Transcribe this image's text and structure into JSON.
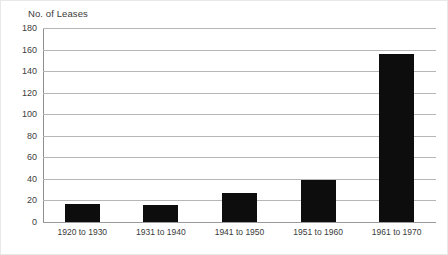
{
  "chart_data": {
    "type": "bar",
    "title": "No. of Leases",
    "xlabel": "",
    "ylabel": "",
    "categories": [
      "1920 to 1930",
      "1931 to 1940",
      "1941 to 1950",
      "1951 to 1960",
      "1961 to 1970"
    ],
    "values": [
      17,
      16,
      27,
      39,
      156
    ],
    "ylim": [
      0,
      180
    ],
    "ytick_step": 20,
    "yticks": [
      180,
      160,
      140,
      120,
      100,
      80,
      60,
      40,
      20,
      0
    ],
    "grid": true,
    "legend": false,
    "bar_color": "#0d0d0d",
    "gridline_color": "#b6b6b6",
    "axis_color": "#8f8f8f",
    "background_color": "#ffffff"
  }
}
